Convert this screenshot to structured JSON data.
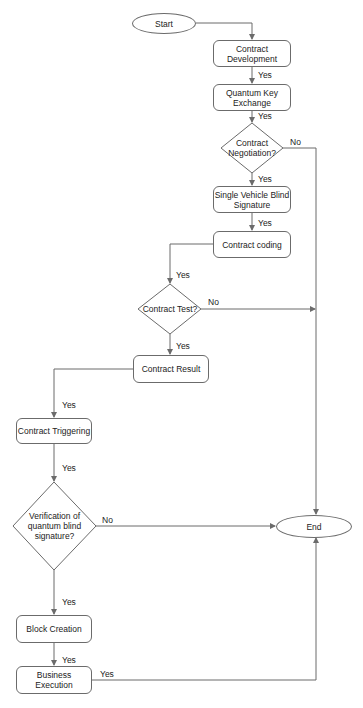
{
  "diagram": {
    "type": "flowchart",
    "line_color": "#6b6b6b",
    "nodes": {
      "start": {
        "label": "Start",
        "shape": "terminal"
      },
      "contract_development": {
        "label": "Contract Development",
        "shape": "process"
      },
      "quantum_key_exchange": {
        "label": "Quantum Key Exchange",
        "shape": "process"
      },
      "contract_negotiation": {
        "label": "Contract Negotiation?",
        "shape": "decision"
      },
      "single_vehicle_blind_signature": {
        "label": "Single Vehicle Blind Signature",
        "shape": "process"
      },
      "contract_coding": {
        "label": "Contract coding",
        "shape": "process"
      },
      "contract_test": {
        "label": "Contract Test?",
        "shape": "decision"
      },
      "contract_result": {
        "label": "Contract Result",
        "shape": "process"
      },
      "contract_triggering": {
        "label": "Contract Triggering",
        "shape": "process"
      },
      "verification": {
        "label": "Verification of quantum blind signature?",
        "shape": "decision"
      },
      "block_creation": {
        "label": "Block Creation",
        "shape": "process"
      },
      "business_execution": {
        "label": "Business Execution",
        "shape": "process"
      },
      "end": {
        "label": "End",
        "shape": "terminal"
      }
    },
    "edges": [
      {
        "from": "start",
        "to": "contract_development",
        "label": ""
      },
      {
        "from": "contract_development",
        "to": "quantum_key_exchange",
        "label": "Yes"
      },
      {
        "from": "quantum_key_exchange",
        "to": "contract_negotiation",
        "label": "Yes"
      },
      {
        "from": "contract_negotiation",
        "to": "single_vehicle_blind_signature",
        "label": "Yes"
      },
      {
        "from": "contract_negotiation",
        "to": "end",
        "label": "No"
      },
      {
        "from": "single_vehicle_blind_signature",
        "to": "contract_coding",
        "label": "Yes"
      },
      {
        "from": "contract_coding",
        "to": "contract_test",
        "label": "Yes"
      },
      {
        "from": "contract_test",
        "to": "contract_result",
        "label": "Yes"
      },
      {
        "from": "contract_test",
        "to": "end",
        "label": "No"
      },
      {
        "from": "contract_result",
        "to": "contract_triggering",
        "label": "Yes"
      },
      {
        "from": "contract_triggering",
        "to": "verification",
        "label": "Yes"
      },
      {
        "from": "verification",
        "to": "block_creation",
        "label": "Yes"
      },
      {
        "from": "verification",
        "to": "end",
        "label": "No"
      },
      {
        "from": "block_creation",
        "to": "business_execution",
        "label": "Yes"
      },
      {
        "from": "business_execution",
        "to": "end",
        "label": "Yes"
      }
    ],
    "edge_labels": {
      "dev_to_qke": "Yes",
      "qke_to_neg": "Yes",
      "neg_no": "No",
      "neg_yes": "Yes",
      "svbs_to_coding": "Yes",
      "coding_to_test": "Yes",
      "test_no": "No",
      "test_yes": "Yes",
      "result_to_trig": "Yes",
      "trig_to_verif": "Yes",
      "verif_no": "No",
      "verif_yes": "Yes",
      "block_to_exec": "Yes",
      "exec_to_end": "Yes"
    }
  }
}
